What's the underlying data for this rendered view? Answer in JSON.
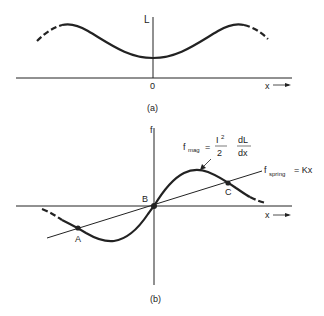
{
  "figure_a": {
    "caption": "(a)",
    "y_axis_label": "L",
    "origin_label": "0",
    "x_axis_label": "x",
    "description": "Inductance L vs displacement x: minimum at x=0, peaks on either side"
  },
  "figure_b": {
    "caption": "(b)",
    "y_axis_label": "f",
    "x_axis_label": "x",
    "mag_label": "f",
    "mag_sub": "mag",
    "mag_eq": "=",
    "mag_num": "I",
    "mag_num_sup": "2",
    "mag_den": "2",
    "deriv_num": "dL",
    "deriv_den": "dx",
    "spring_label": "f",
    "spring_sub": "spring",
    "spring_eq": "= Kx",
    "points": [
      {
        "label": "A"
      },
      {
        "label": "B"
      },
      {
        "label": "C"
      }
    ]
  },
  "colors": {
    "ink": "#222222",
    "background": "#ffffff"
  }
}
